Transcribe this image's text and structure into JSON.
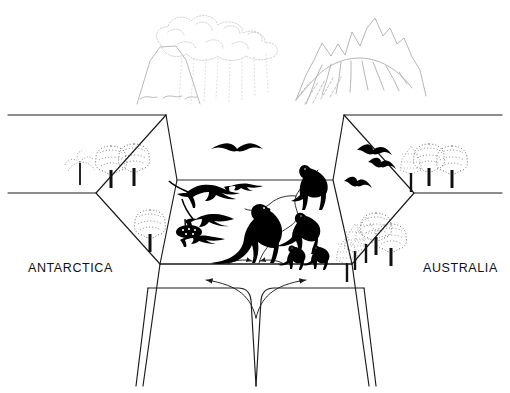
{
  "figure": {
    "type": "block-diagram",
    "background_color": "#ffffff",
    "line_color": "#1a1a1a",
    "faint_line_color": "#b9b9b9",
    "silhouette_color": "#000000"
  },
  "labels": {
    "left_continent": "ANTARCTICA",
    "right_continent": "AUSTRALIA"
  },
  "landforms": {
    "volcano": {
      "name": "volcano",
      "has_ash_cloud": true,
      "has_ashfall": true,
      "ashfall_streaks": 8
    },
    "mountain_range": {
      "name": "mountain-range",
      "peaks": 7,
      "has_river_outflow": true
    },
    "rift_valley": {
      "name": "rift-valley-floor",
      "has_river": true
    }
  },
  "tectonics": {
    "left_arrow": "spreading-left",
    "right_arrow": "spreading-right",
    "top_left_arrow": "surface-drift-left",
    "top_right_arrow": "surface-drift-right"
  },
  "biota": {
    "large_theropod": "large-theropod-silhouette",
    "medium_theropods": 1,
    "small_theropods": 2,
    "sauropods": 3,
    "rift_edge_theropod": "rift-edge-theropod-silhouette",
    "pterosaurs": 4,
    "ammonite_or_shrub": "low-shrub",
    "trees_left_plateau": 4,
    "trees_right_plateau": 8
  }
}
